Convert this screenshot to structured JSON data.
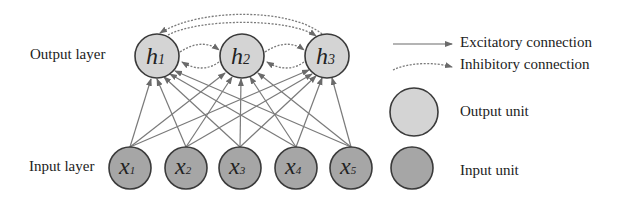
{
  "diagram": {
    "output_layer_label": "Output layer",
    "input_layer_label": "Input layer",
    "output_units": [
      {
        "main": "h",
        "sub": "1"
      },
      {
        "main": "h",
        "sub": "2"
      },
      {
        "main": "h",
        "sub": "3"
      }
    ],
    "input_units": [
      {
        "main": "x",
        "sub": "1"
      },
      {
        "main": "x",
        "sub": "2"
      },
      {
        "main": "x",
        "sub": "3"
      },
      {
        "main": "x",
        "sub": "4"
      },
      {
        "main": "x",
        "sub": "5"
      }
    ],
    "connections": {
      "excitatory": "all input units connect to all output units",
      "inhibitory": "lateral between output units h1-h2, h2-h3, h1-h3"
    }
  },
  "legend": {
    "excitatory_label": "Excitatory connection",
    "inhibitory_label": "Inhibitory connection",
    "output_unit_label": "Output unit",
    "input_unit_label": "Input unit"
  },
  "colors": {
    "output_fill": "#d4d4d4",
    "input_fill": "#a6a6a6",
    "stroke": "#3a3a3a",
    "line": "#707070"
  }
}
